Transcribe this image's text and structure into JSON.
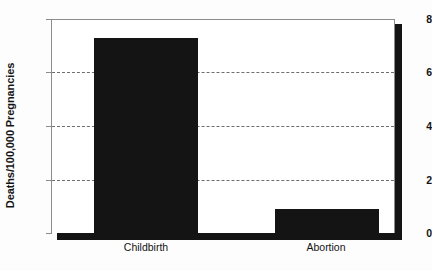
{
  "chart_data": {
    "type": "bar",
    "title": "",
    "subtitle": "",
    "xlabel": "",
    "ylabel": "Deaths/100,000 Pregnancies",
    "categories": [
      "Childbirth",
      "Abortion"
    ],
    "values": [
      7.3,
      0.9
    ],
    "series": [
      {
        "name": "Deaths per 100,000 pregnancies",
        "values": [
          7.3,
          0.9
        ]
      }
    ],
    "ylim": [
      0,
      8
    ],
    "yticks": [
      0,
      2,
      4,
      6,
      8
    ],
    "ytick_labels": [
      "0",
      "2",
      "4",
      "6",
      "8"
    ],
    "gridlines": [
      2,
      4,
      6
    ],
    "grid": true,
    "legend": false,
    "legend_position": "none",
    "bar_color": "#141414",
    "grid_color": "#6e6e6e",
    "axis_color": "#8c8c8c",
    "background_color": "#ffffff",
    "annotations": []
  },
  "axes": {
    "y_title": "Deaths/100,000 Pregnancies",
    "y_ticks": [
      {
        "label": "8",
        "value": 8
      },
      {
        "label": "6",
        "value": 6
      },
      {
        "label": "4",
        "value": 4
      },
      {
        "label": "2",
        "value": 2
      },
      {
        "label": "0",
        "value": 0
      }
    ],
    "x_ticks": [
      {
        "label": "Childbirth"
      },
      {
        "label": "Abortion"
      }
    ]
  }
}
